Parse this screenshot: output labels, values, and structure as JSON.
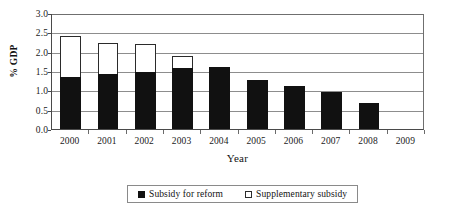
{
  "chart_data": {
    "type": "bar",
    "subtype": "stacked-bar",
    "title": "",
    "xlabel": "Year",
    "ylabel": "% GDP",
    "categories": [
      "2000",
      "2001",
      "2002",
      "2003",
      "2004",
      "2005",
      "2006",
      "2007",
      "2008",
      "2009"
    ],
    "series": [
      {
        "name": "Subsidy for reform",
        "color": "#111111",
        "values": [
          1.35,
          1.42,
          1.48,
          1.57,
          1.6,
          1.27,
          1.1,
          0.95,
          0.68,
          0.0
        ]
      },
      {
        "name": "Supplementary subsidy",
        "color": "#ffffff",
        "values": [
          1.05,
          0.81,
          0.73,
          0.33,
          0.0,
          0.0,
          0.0,
          0.0,
          0.0,
          0.0
        ]
      }
    ],
    "totals": [
      2.4,
      2.23,
      2.21,
      1.9,
      1.6,
      1.27,
      1.1,
      0.95,
      0.68,
      0.0
    ],
    "ylim": [
      0.0,
      3.0
    ],
    "ytick_labels": [
      "0.0",
      "0.5",
      "1.0",
      "1.5",
      "2.0",
      "2.5",
      "3.0"
    ],
    "ytick_values": [
      0.0,
      0.5,
      1.0,
      1.5,
      2.0,
      2.5,
      3.0
    ],
    "grid": true,
    "grid_axis": "y",
    "legend_position": "bottom"
  },
  "axis": {
    "y_title": "% GDP",
    "x_title": "Year"
  },
  "legend": {
    "entries": [
      {
        "label": "Subsidy for reform",
        "marker": "filled-square-icon"
      },
      {
        "label": "Supplementary subsidy",
        "marker": "hollow-square-icon"
      }
    ]
  }
}
